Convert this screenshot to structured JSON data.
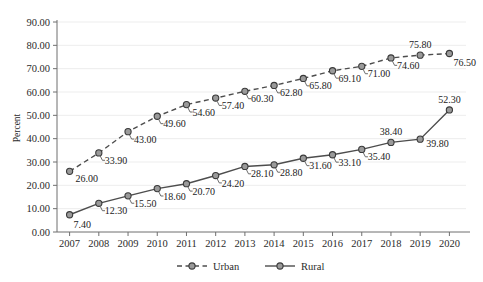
{
  "chart_data": {
    "type": "line",
    "title": "",
    "xlabel": "",
    "ylabel": "Percent",
    "categories": [
      "2007",
      "2008",
      "2009",
      "2010",
      "2011",
      "2012",
      "2013",
      "2014",
      "2015",
      "2016",
      "2017",
      "2018",
      "2019",
      "2020"
    ],
    "ylim": [
      0,
      90
    ],
    "ytick_step": 10,
    "ytick_labels": [
      "0.00",
      "10.00",
      "20.00",
      "30.00",
      "40.00",
      "50.00",
      "60.00",
      "70.00",
      "80.00",
      "90.00"
    ],
    "ytick_values": [
      0,
      10,
      20,
      30,
      40,
      50,
      60,
      70,
      80,
      90
    ],
    "grid": "horizontal",
    "legend_position": "bottom",
    "series": [
      {
        "name": "Urban",
        "style": "dashed",
        "color": "#4d4d4d",
        "marker": "circle",
        "marker_fill": "#9a9a9a",
        "values": [
          26.0,
          33.9,
          43.0,
          49.6,
          54.6,
          57.4,
          60.3,
          62.8,
          65.8,
          69.1,
          71.0,
          74.6,
          75.8,
          76.5
        ],
        "labels": [
          "26.00",
          "33.90",
          "43.00",
          "49.60",
          "54.60",
          "57.40",
          "60.30",
          "62.80",
          "65.80",
          "69.10",
          "71.00",
          "74.60",
          "75.80",
          "76.50"
        ]
      },
      {
        "name": "Rural",
        "style": "solid",
        "color": "#4d4d4d",
        "marker": "circle",
        "marker_fill": "#9a9a9a",
        "values": [
          7.4,
          12.3,
          15.5,
          18.6,
          20.7,
          24.2,
          28.1,
          28.8,
          31.6,
          33.1,
          35.4,
          38.4,
          39.8,
          52.3
        ],
        "labels": [
          "7.40",
          "12.30",
          "15.50",
          "18.60",
          "20.70",
          "24.20",
          "28.10",
          "28.80",
          "31.60",
          "33.10",
          "35.40",
          "38.40",
          "39.80",
          "52.30"
        ]
      }
    ]
  },
  "legend": {
    "items": [
      {
        "label": "Urban",
        "style": "dashed"
      },
      {
        "label": "Rural",
        "style": "solid"
      }
    ]
  },
  "colors": {
    "line": "#4d4d4d",
    "marker_fill": "#9a9a9a",
    "marker_stroke": "#3a3a3a",
    "axis": "#6f6f6f",
    "grid": "#ededed",
    "text": "#2b2b2b",
    "background": "#ffffff"
  }
}
